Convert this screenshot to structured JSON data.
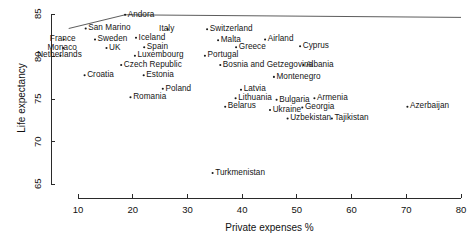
{
  "chart_data": {
    "type": "scatter",
    "title": "",
    "xlabel": "Private expenses %",
    "ylabel": "Life expectancy",
    "xlim": [
      6,
      82
    ],
    "ylim": [
      63.8,
      85.6
    ],
    "xticks": [
      10,
      20,
      30,
      40,
      50,
      60,
      70,
      80
    ],
    "yticks": [
      65,
      70,
      75,
      80,
      85
    ],
    "grid": false,
    "legend": null,
    "trend_line": {
      "present": true,
      "description": "line rising from left edge to a peak near Andorra then nearly flat to the right edge",
      "points": [
        {
          "x": 8.3,
          "y": 83.3
        },
        {
          "x": 18.6,
          "y": 84.9
        },
        {
          "x": 80.0,
          "y": 84.6
        }
      ]
    },
    "points": [
      {
        "label": "San Marino",
        "x": 11.4,
        "y": 83.3,
        "label_pos": "right"
      },
      {
        "label": "Andora",
        "x": 18.6,
        "y": 84.9,
        "label_pos": "right"
      },
      {
        "label": "Italy",
        "x": 26.4,
        "y": 83.2,
        "label_pos": "center"
      },
      {
        "label": "Switzerland",
        "x": 33.6,
        "y": 83.2,
        "label_pos": "right"
      },
      {
        "label": "France",
        "x": 7.4,
        "y": 82.0,
        "label_pos": "center"
      },
      {
        "label": "Sweden",
        "x": 13.1,
        "y": 82.0,
        "label_pos": "right"
      },
      {
        "label": "Iceland",
        "x": 20.6,
        "y": 82.2,
        "label_pos": "right"
      },
      {
        "label": "Malta",
        "x": 35.6,
        "y": 81.9,
        "label_pos": "right"
      },
      {
        "label": "Airland",
        "x": 44.2,
        "y": 82.0,
        "label_pos": "right"
      },
      {
        "label": "Monaco",
        "x": 7.3,
        "y": 81.0,
        "label_pos": "center"
      },
      {
        "label": "UK",
        "x": 15.2,
        "y": 81.0,
        "label_pos": "right"
      },
      {
        "label": "Spain",
        "x": 22.1,
        "y": 81.1,
        "label_pos": "right"
      },
      {
        "label": "Greece",
        "x": 38.9,
        "y": 81.1,
        "label_pos": "right"
      },
      {
        "label": "Cyprus",
        "x": 50.6,
        "y": 81.2,
        "label_pos": "right"
      },
      {
        "label": "Netherlands",
        "x": 6.8,
        "y": 80.1,
        "label_pos": "center"
      },
      {
        "label": "Luxembourg",
        "x": 20.4,
        "y": 80.1,
        "label_pos": "right"
      },
      {
        "label": "Portugal",
        "x": 33.2,
        "y": 80.1,
        "label_pos": "right"
      },
      {
        "label": "Czech Republic",
        "x": 17.9,
        "y": 79.0,
        "label_pos": "right"
      },
      {
        "label": "Bosnia and Getzegovina",
        "x": 36.0,
        "y": 79.0,
        "label_pos": "right"
      },
      {
        "label": "Albania",
        "x": 51.2,
        "y": 79.0,
        "label_pos": "right"
      },
      {
        "label": "Croatia",
        "x": 11.2,
        "y": 77.8,
        "label_pos": "right"
      },
      {
        "label": "Estonia",
        "x": 22.0,
        "y": 77.8,
        "label_pos": "right"
      },
      {
        "label": "Montenegro",
        "x": 45.8,
        "y": 77.6,
        "label_pos": "right"
      },
      {
        "label": "Poland",
        "x": 25.5,
        "y": 76.2,
        "label_pos": "right"
      },
      {
        "label": "Latvia",
        "x": 39.8,
        "y": 76.1,
        "label_pos": "right"
      },
      {
        "label": "Romania",
        "x": 19.6,
        "y": 75.2,
        "label_pos": "right"
      },
      {
        "label": "Lithuania",
        "x": 38.8,
        "y": 75.1,
        "label_pos": "right"
      },
      {
        "label": "Bulgaria",
        "x": 46.3,
        "y": 74.9,
        "label_pos": "right"
      },
      {
        "label": "Armenia",
        "x": 53.2,
        "y": 75.1,
        "label_pos": "right"
      },
      {
        "label": "Azerbaijan",
        "x": 70.2,
        "y": 74.1,
        "label_pos": "right"
      },
      {
        "label": "Belarus",
        "x": 36.9,
        "y": 74.1,
        "label_pos": "right"
      },
      {
        "label": "Ukraine",
        "x": 45.1,
        "y": 73.7,
        "label_pos": "right"
      },
      {
        "label": "Georgia",
        "x": 51.0,
        "y": 74.0,
        "label_pos": "right"
      },
      {
        "label": "Uzbekistan",
        "x": 48.3,
        "y": 72.7,
        "label_pos": "right"
      },
      {
        "label": "Tajikistan",
        "x": 56.4,
        "y": 72.7,
        "label_pos": "right"
      },
      {
        "label": "Turkmenistan",
        "x": 34.6,
        "y": 66.3,
        "label_pos": "right"
      }
    ]
  },
  "axes": {
    "x_title": "Private expenses %",
    "y_title": "Life expectancy",
    "x_tick_labels": [
      "10",
      "20",
      "30",
      "40",
      "50",
      "60",
      "70",
      "80"
    ],
    "y_tick_labels": [
      "65",
      "70",
      "75",
      "80",
      "85"
    ]
  },
  "style": {
    "axis_color": "#2a2a2a",
    "point_color": "#1a1a1a",
    "line_color": "#4a4a4a",
    "text_color": "#141414",
    "background": "#ffffff"
  }
}
